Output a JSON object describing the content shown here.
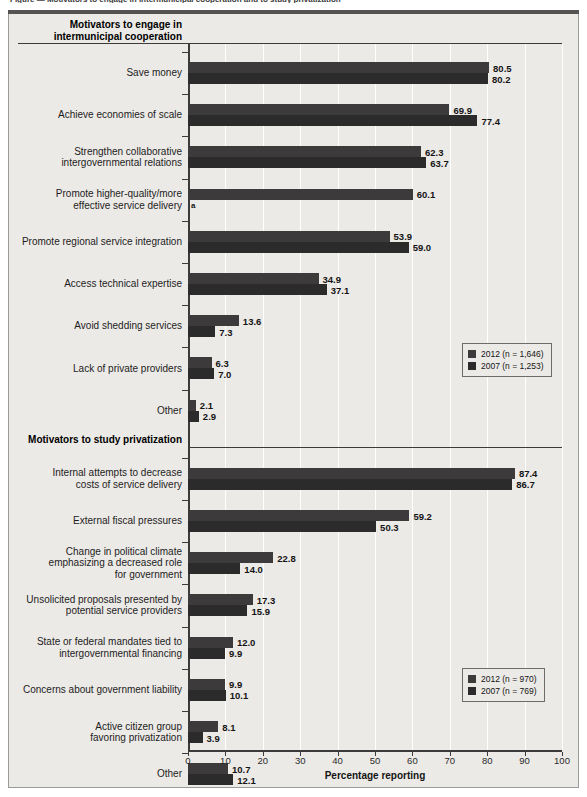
{
  "figure": {
    "cut_title": "Figure — Motivators to engage in intermunicipal cooperation and to study privatization",
    "xaxis_label": "Percentage reporting",
    "footnote_marker": "a"
  },
  "chart_data": {
    "type": "bar",
    "orientation": "horizontal",
    "title": "",
    "xlabel": "Percentage reporting",
    "ylabel": "",
    "xlim": [
      0,
      100
    ],
    "xticks": [
      0,
      10,
      20,
      30,
      40,
      50,
      60,
      70,
      80,
      90,
      100
    ],
    "grid": true,
    "grid_axis": "x",
    "legend_position": "right",
    "colors": {
      "2012": "#3c3a3a",
      "2007": "#2c2b2b"
    },
    "panels": [
      {
        "heading": "Motivators to engage in\nintermunicipal cooperation",
        "heading_lines": [
          "Motivators to engage in",
          "intermunicipal cooperation"
        ],
        "legend": [
          {
            "label": "2012 (n = 1,646)",
            "series": "2012"
          },
          {
            "label": "2007 (n = 1,253)",
            "series": "2007"
          }
        ],
        "categories": [
          {
            "lines": [
              "Save money"
            ],
            "v2012": 80.5,
            "v2007": 80.2
          },
          {
            "lines": [
              "Achieve economies of scale"
            ],
            "v2012": 69.9,
            "v2007": 77.4
          },
          {
            "lines": [
              "Strengthen collaborative",
              "intergovernmental relations"
            ],
            "v2012": 62.3,
            "v2007": 63.7
          },
          {
            "lines": [
              "Promote higher-quality/more",
              "effective service delivery"
            ],
            "v2012": 60.1,
            "v2007": null,
            "note": "a"
          },
          {
            "lines": [
              "Promote regional service integration"
            ],
            "v2012": 53.9,
            "v2007": 59.0
          },
          {
            "lines": [
              "Access technical expertise"
            ],
            "v2012": 34.9,
            "v2007": 37.1
          },
          {
            "lines": [
              "Avoid shedding services"
            ],
            "v2012": 13.6,
            "v2007": 7.3
          },
          {
            "lines": [
              "Lack of private providers"
            ],
            "v2012": 6.3,
            "v2007": 7.0
          },
          {
            "lines": [
              "Other"
            ],
            "v2012": 2.1,
            "v2007": 2.9
          }
        ]
      },
      {
        "heading": "Motivators to study privatization",
        "heading_lines": [
          "Motivators to study privatization"
        ],
        "legend": [
          {
            "label": "2012 (n = 970)",
            "series": "2012"
          },
          {
            "label": "2007 (n = 769)",
            "series": "2007"
          }
        ],
        "categories": [
          {
            "lines": [
              "Internal attempts to decrease",
              "costs of service delivery"
            ],
            "v2012": 87.4,
            "v2007": 86.7
          },
          {
            "lines": [
              "External fiscal pressures"
            ],
            "v2012": 59.2,
            "v2007": 50.3
          },
          {
            "lines": [
              "Change in political climate",
              "emphasizing a decreased role",
              "for government"
            ],
            "v2012": 22.8,
            "v2007": 14.0
          },
          {
            "lines": [
              "Unsolicited proposals presented by",
              "potential service providers"
            ],
            "v2012": 17.3,
            "v2007": 15.9
          },
          {
            "lines": [
              "State or federal mandates tied to",
              "intergovernmental financing"
            ],
            "v2012": 12.0,
            "v2007": 9.9
          },
          {
            "lines": [
              "Concerns about government liability"
            ],
            "v2012": 9.9,
            "v2007": 10.1
          },
          {
            "lines": [
              "Active citizen group",
              "favoring privatization"
            ],
            "v2012": 8.1,
            "v2007": 3.9
          },
          {
            "lines": [
              "Other"
            ],
            "v2012": 10.7,
            "v2007": 12.1
          }
        ]
      }
    ]
  }
}
